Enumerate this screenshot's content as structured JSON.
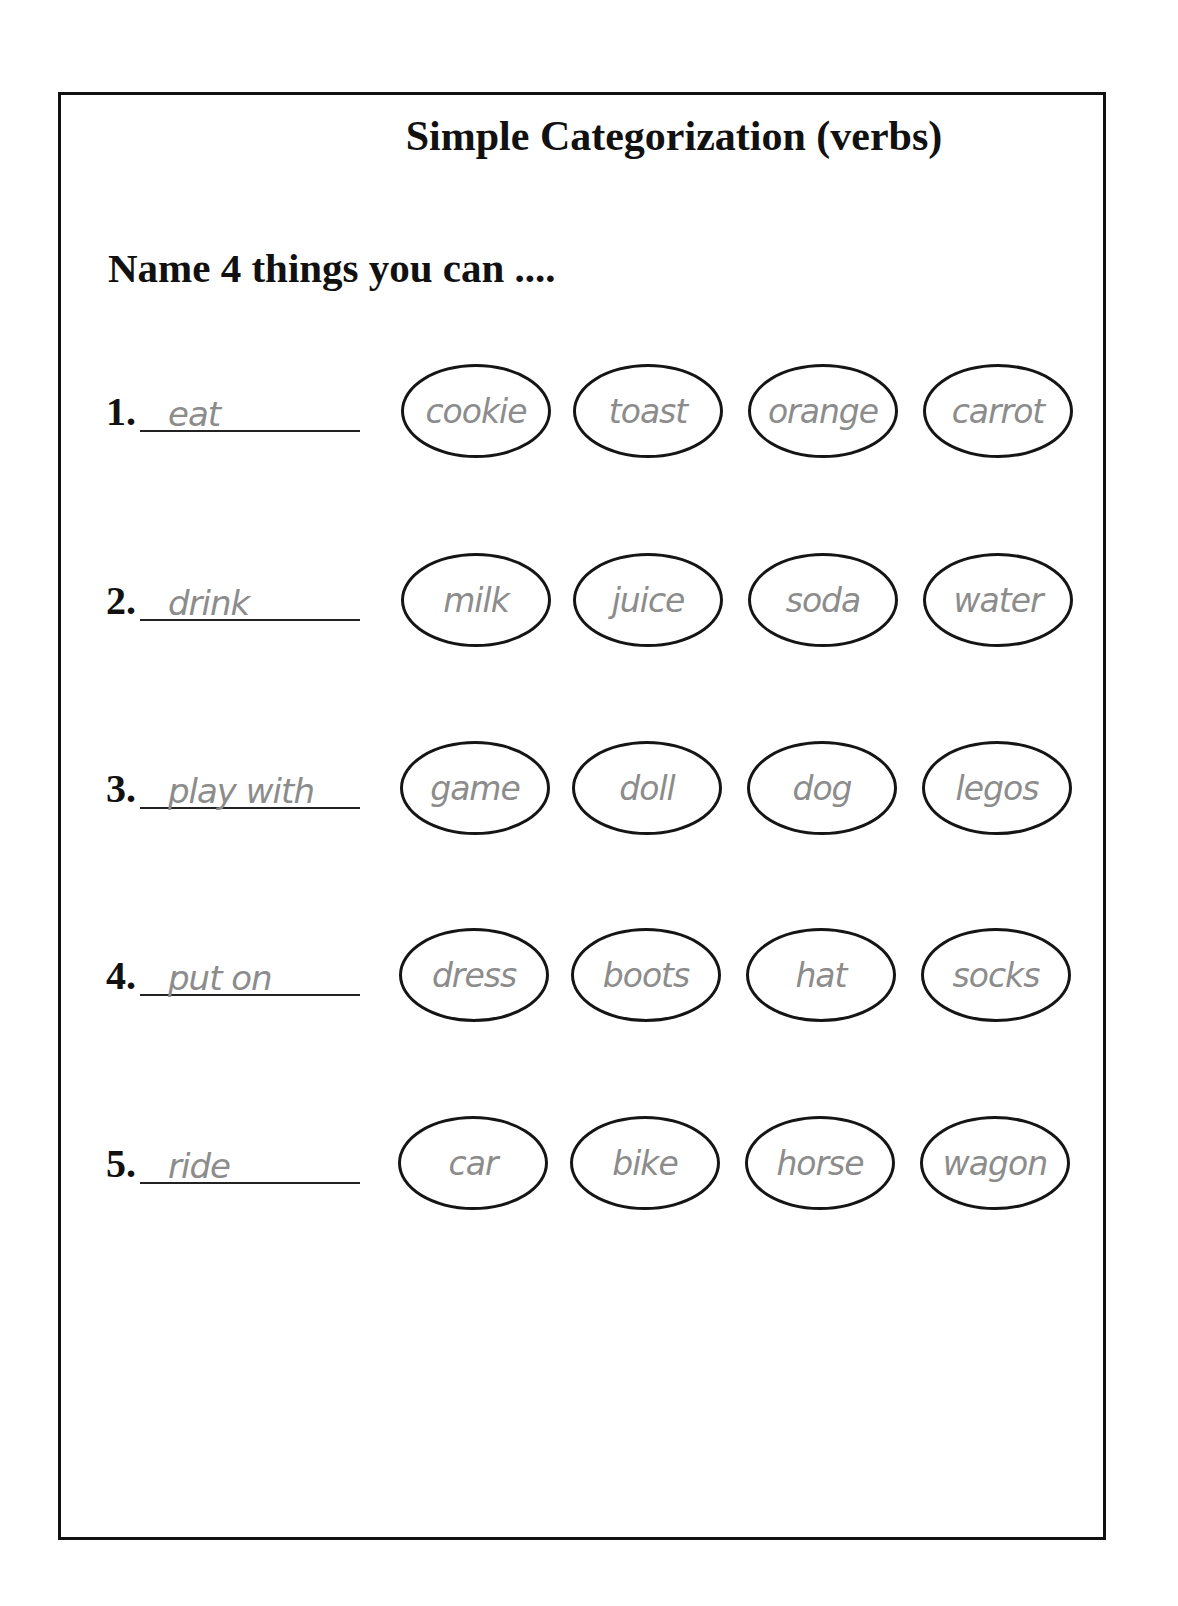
{
  "worksheet": {
    "title": "Simple Categorization (verbs)",
    "prompt": "Name 4 things you can ....",
    "items": [
      {
        "number": "1.",
        "verb": "eat",
        "answers": [
          "cookie",
          "toast",
          "orange",
          "carrot"
        ]
      },
      {
        "number": "2.",
        "verb": "drink",
        "answers": [
          "milk",
          "juice",
          "soda",
          "water"
        ]
      },
      {
        "number": "3.",
        "verb": "play with",
        "answers": [
          "game",
          "doll",
          "dog",
          "legos"
        ]
      },
      {
        "number": "4.",
        "verb": "put on",
        "answers": [
          "dress",
          "boots",
          "hat",
          "socks"
        ]
      },
      {
        "number": "5.",
        "verb": "ride",
        "answers": [
          "car",
          "bike",
          "horse",
          "wagon"
        ]
      }
    ]
  },
  "colors": {
    "ink": "#111111",
    "answer_text": "#8c8c8c",
    "background": "#ffffff"
  }
}
